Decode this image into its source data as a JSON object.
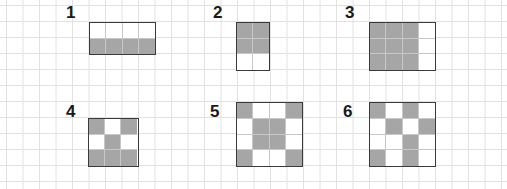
{
  "grid": {
    "cell_size": 16.5,
    "line_color": "#e2e2e2",
    "origin_x": 6.5,
    "origin_y": 5.5
  },
  "colors": {
    "shaded": "#a6a6a6",
    "unshaded": "#ffffff",
    "outline": "#3a3a3a"
  },
  "shapes": [
    {
      "label": "1",
      "label_x": 66,
      "label_y": 4,
      "x": 89,
      "y": 22,
      "cols": 4,
      "rows": 2,
      "cells": [
        "wwww",
        "gggg"
      ]
    },
    {
      "label": "2",
      "label_x": 213,
      "label_y": 4,
      "x": 236,
      "y": 22,
      "cols": 2,
      "rows": 3,
      "cells": [
        "gg",
        "gg",
        "ww"
      ]
    },
    {
      "label": "3",
      "label_x": 345,
      "label_y": 4,
      "x": 369,
      "y": 22,
      "cols": 4,
      "rows": 3,
      "cells": [
        "gggw",
        "gggw",
        "gggw"
      ]
    },
    {
      "label": "4",
      "label_x": 66,
      "label_y": 103,
      "x": 88,
      "y": 118,
      "cols": 3,
      "rows": 3,
      "cells": [
        "gwg",
        "wgw",
        "ggg"
      ]
    },
    {
      "label": "5",
      "label_x": 210,
      "label_y": 103,
      "x": 236,
      "y": 102,
      "cols": 4,
      "rows": 4,
      "cells": [
        "gwwg",
        "wggw",
        "wggw",
        "gwwg"
      ]
    },
    {
      "label": "6",
      "label_x": 343,
      "label_y": 103,
      "x": 369,
      "y": 102,
      "cols": 4,
      "rows": 4,
      "cells": [
        "gwgw",
        "wgwg",
        "wwgw",
        "gwgw"
      ]
    }
  ]
}
